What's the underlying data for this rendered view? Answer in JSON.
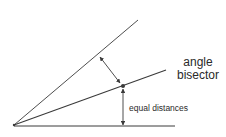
{
  "diagram": {
    "title": "Angle bisector",
    "labels": {
      "bisector_line1": "angle",
      "bisector_line2": "bisector",
      "distances": "equal distances"
    },
    "colors": {
      "line": "#3a3a3a",
      "text": "#2a2a2a",
      "background": "#ffffff"
    },
    "elements": [
      "vertex",
      "upper-ray",
      "angle-bisector-ray",
      "baseline-ray",
      "point-on-bisector",
      "perpendicular-arrow-to-upper-ray",
      "perpendicular-arrow-to-baseline"
    ]
  }
}
